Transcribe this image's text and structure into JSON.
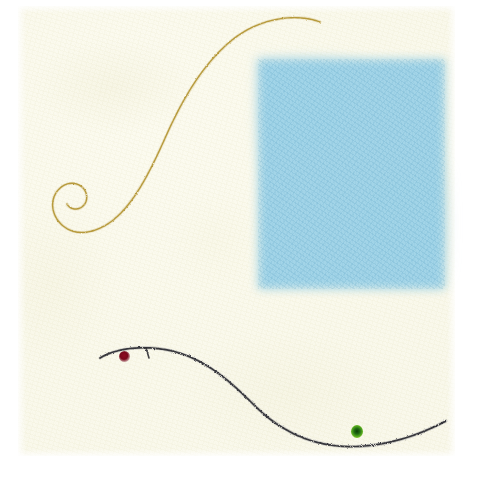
{
  "artwork": {
    "title": "Abstract composition on handmade paper",
    "medium": "mixed media on cream textured paper",
    "canvas": {
      "width": 480,
      "height": 488,
      "background": "#ffffff"
    },
    "paper": {
      "label": "cream textured paper sheet",
      "color": "#faf9ec",
      "edge_color": "#ffffff",
      "x": 18,
      "y": 6,
      "width": 437,
      "height": 450
    },
    "elements": [
      {
        "id": "blue-square",
        "label": "soft-edged light blue square",
        "color": "#9ed3e8",
        "x": 258,
        "y": 59,
        "width": 187,
        "height": 230,
        "edge": "feathered"
      },
      {
        "id": "gold-curve",
        "label": "thin golden S-curve with spiral terminus",
        "color": "#b79a3e",
        "stroke_width": 1.4,
        "path": "M 320 22 C 296 13 262 18 236 37 C 205 60 183 98 166 136 C 150 172 134 204 112 221 C 96 233 78 236 66 228 C 55 221 50 208 54 197 C 58 186 70 180 79 185 C 87 189 89 199 84 205 C 79 211 70 210 67 204",
        "terminus": "inward counterclockwise spiral at lower left"
      },
      {
        "id": "dark-curve",
        "label": "dark graphite S-curve sweeping down and right",
        "color": "#2e2e33",
        "stroke_width": 1.6,
        "path": "M 100 358 C 116 348 146 344 176 352 C 208 361 232 383 254 405 C 278 429 306 443 338 446 C 372 449 410 440 446 421"
      },
      {
        "id": "dot-red",
        "label": "dark red point",
        "color": "#79081c",
        "x": 125,
        "y": 357,
        "radius": 5
      },
      {
        "id": "dot-green",
        "label": "bright green point",
        "color": "#54a81f",
        "x": 357,
        "y": 432,
        "radius": 6
      },
      {
        "id": "tick-mark",
        "label": "small dark tick mark on upper curve",
        "color": "#2e2e33",
        "x": 147,
        "y": 352
      }
    ]
  }
}
